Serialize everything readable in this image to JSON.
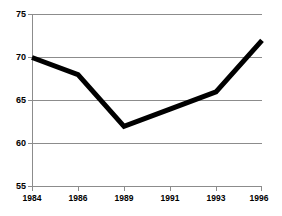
{
  "chart_data": {
    "type": "line",
    "title": "",
    "xlabel": "",
    "ylabel": "",
    "categories": [
      "1984",
      "1986",
      "1989",
      "1991",
      "1993",
      "1996"
    ],
    "values": [
      70,
      68,
      62,
      64,
      66,
      72
    ],
    "series": [
      {
        "name": "series-1",
        "values": [
          70,
          68,
          62,
          64,
          66,
          72
        ],
        "color": "#000000"
      }
    ],
    "ylim": [
      55,
      75
    ],
    "yticks": [
      55,
      60,
      65,
      70,
      75
    ],
    "ytick_labels": [
      "55",
      "60",
      "65",
      "70",
      "75"
    ],
    "xtick_labels": [
      "1984",
      "1986",
      "1989",
      "1991",
      "1993",
      "1996"
    ],
    "grid": true,
    "grid_axis": "y",
    "legend": false,
    "legend_position": "none",
    "annotations": [],
    "colors": {
      "line": "#000000",
      "grid": "#8c8c8c",
      "axis": "#8c8c8c",
      "background": "#ffffff",
      "text": "#000000"
    }
  }
}
